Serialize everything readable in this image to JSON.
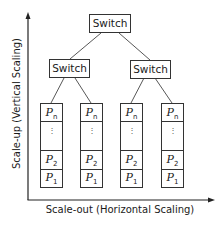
{
  "diagram": {
    "axes": {
      "x_label": "Scale-out (Horizontal Scaling)",
      "y_label": "Scale-up (Vertical Scaling)"
    },
    "switches": {
      "root": "Switch",
      "left": "Switch",
      "right": "Switch"
    },
    "columns": [
      {
        "top": "P",
        "top_sub": "n",
        "dots": "⋮",
        "mid": "P",
        "mid_sub": "2",
        "bottom": "P",
        "bottom_sub": "1"
      },
      {
        "top": "P",
        "top_sub": "n",
        "dots": "⋮",
        "mid": "P",
        "mid_sub": "2",
        "bottom": "P",
        "bottom_sub": "1"
      },
      {
        "top": "P",
        "top_sub": "n",
        "dots": "⋮",
        "mid": "P",
        "mid_sub": "2",
        "bottom": "P",
        "bottom_sub": "1"
      },
      {
        "top": "P",
        "top_sub": "n",
        "dots": "⋮",
        "mid": "P",
        "mid_sub": "2",
        "bottom": "P",
        "bottom_sub": "1"
      }
    ]
  }
}
